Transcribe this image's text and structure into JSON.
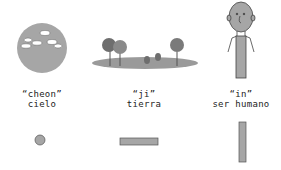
{
  "colors": {
    "shape_fill": "#a6a6a6",
    "shape_stroke": "#555555",
    "tree_dark": "#7a7a7a",
    "cloud": "#ffffff"
  },
  "panels": [
    {
      "romanization": "“cheon”",
      "meaning": "cielo",
      "illustration": "sky-circle-with-clouds",
      "symbol": "dot"
    },
    {
      "romanization": "“ji”",
      "meaning": "tierra",
      "illustration": "ground-with-trees",
      "symbol": "horizontal-bar"
    },
    {
      "romanization": "“in”",
      "meaning": "ser humano",
      "illustration": "standing-person",
      "symbol": "vertical-bar"
    }
  ]
}
